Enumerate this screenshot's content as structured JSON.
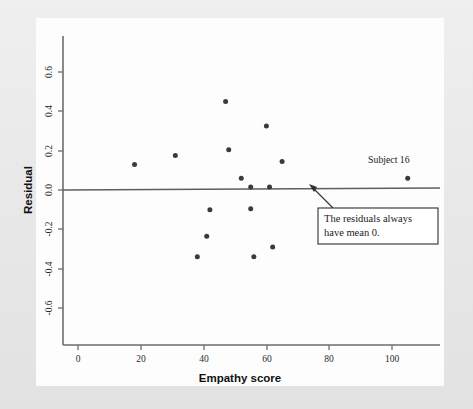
{
  "figure": {
    "background_color": "#e9e9e9",
    "plot_background_color": "#ffffff",
    "axis_color": "#6d6d6d",
    "point_color": "#3a3a3a"
  },
  "chart_data": {
    "type": "scatter",
    "title": "",
    "xlabel": "Empathy score",
    "ylabel": "Residual",
    "xlim": [
      -6,
      114
    ],
    "ylim": [
      -0.74,
      0.72
    ],
    "xticks": [
      0,
      20,
      40,
      60,
      80,
      100
    ],
    "xticklabels": [
      "0",
      "20",
      "40",
      "60",
      "80",
      "100"
    ],
    "yticks": [
      -0.6,
      -0.4,
      -0.2,
      0.0,
      0.2,
      0.4,
      0.6
    ],
    "yticklabels": [
      "-0.6",
      "-0.4",
      "-0.2",
      "0.0",
      "0.2",
      "0.4",
      "0.6"
    ],
    "grid": false,
    "legend": null,
    "reference_line": {
      "type": "horizontal",
      "y": 0.0,
      "label": "zero residual line"
    },
    "points": [
      {
        "x": 18,
        "y": 0.13
      },
      {
        "x": 31,
        "y": 0.175
      },
      {
        "x": 38,
        "y": -0.34
      },
      {
        "x": 41,
        "y": -0.235
      },
      {
        "x": 42,
        "y": -0.1
      },
      {
        "x": 47,
        "y": 0.45
      },
      {
        "x": 48,
        "y": 0.205
      },
      {
        "x": 52,
        "y": 0.06
      },
      {
        "x": 55,
        "y": 0.015
      },
      {
        "x": 55,
        "y": -0.095
      },
      {
        "x": 56,
        "y": -0.34
      },
      {
        "x": 60,
        "y": 0.325
      },
      {
        "x": 61,
        "y": 0.015
      },
      {
        "x": 62,
        "y": -0.29
      },
      {
        "x": 65,
        "y": 0.145
      },
      {
        "x": 105,
        "y": 0.06
      }
    ],
    "annotations": [
      {
        "name": "subject-16-label",
        "text": "Subject 16",
        "x": 99,
        "y": 0.135
      },
      {
        "name": "mean-zero-callout",
        "text_lines": [
          "The residuals always",
          "have mean 0."
        ],
        "points_to_x": 90,
        "points_to_y": 0.0
      }
    ]
  }
}
